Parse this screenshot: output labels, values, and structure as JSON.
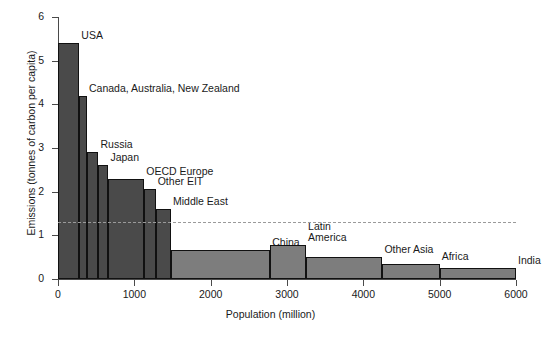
{
  "chart_data": {
    "type": "bar",
    "title": "",
    "subtitle": "",
    "xlabel": "Population (million)",
    "ylabel": "Emissions (tonnes of carbon per capita)",
    "xlim": [
      0,
      6000
    ],
    "ylim": [
      0,
      6
    ],
    "xticks": [
      0,
      1000,
      2000,
      3000,
      4000,
      5000,
      6000
    ],
    "xtick_labels": [
      "0",
      "1000",
      "2000",
      "3000",
      "4000",
      "5000",
      "6000"
    ],
    "yticks": [
      0,
      1,
      2,
      3,
      4,
      5,
      6
    ],
    "ytick_labels": [
      "0",
      "1",
      "2",
      "3",
      "4",
      "5",
      "6"
    ],
    "grid": false,
    "legend": "none",
    "note": "Variable-width bar chart (Marimekko style): bar width = population, bar height = per-capita emissions",
    "annotations": [
      {
        "name": "world-average-reference-line",
        "style": "dashed",
        "orientation": "horizontal",
        "y_value": 1.3,
        "color": "#9a9a9a",
        "x_from": 0,
        "x_to": 6000
      }
    ],
    "bars": [
      {
        "label": "USA",
        "x_start": 0,
        "x_end": 280,
        "population": 280,
        "emissions": 5.4,
        "color": "#4a4a4a",
        "label_pos": "above-right"
      },
      {
        "label": "Canada, Australia, New Zealand",
        "x_start": 280,
        "x_end": 380,
        "population": 100,
        "emissions": 4.2,
        "color": "#4a4a4a",
        "label_pos": "above-right"
      },
      {
        "label": "Russia",
        "x_start": 380,
        "x_end": 530,
        "population": 150,
        "emissions": 2.9,
        "color": "#4a4a4a",
        "label_pos": "above-right"
      },
      {
        "label": "Japan",
        "x_start": 530,
        "x_end": 660,
        "population": 130,
        "emissions": 2.6,
        "color": "#4a4a4a",
        "label_pos": "above-right"
      },
      {
        "label": "OECD Europe",
        "x_start": 660,
        "x_end": 1130,
        "population": 470,
        "emissions": 2.3,
        "color": "#4a4a4a",
        "label_pos": "above-right"
      },
      {
        "label": "Other EIT",
        "x_start": 1130,
        "x_end": 1280,
        "population": 150,
        "emissions": 2.05,
        "color": "#4a4a4a",
        "label_pos": "above-right"
      },
      {
        "label": "Middle East",
        "x_start": 1280,
        "x_end": 1480,
        "population": 200,
        "emissions": 1.6,
        "color": "#4a4a4a",
        "label_pos": "above-right"
      },
      {
        "label": "China",
        "x_start": 1480,
        "x_end": 2780,
        "population": 1300,
        "emissions": 0.67,
        "color": "#7d7d7d",
        "label_pos": "above-right"
      },
      {
        "label": "Latin America",
        "x_start": 2780,
        "x_end": 3250,
        "population": 470,
        "emissions": 0.78,
        "color": "#7d7d7d",
        "label_pos": "above-right"
      },
      {
        "label": "Other Asia",
        "x_start": 3250,
        "x_end": 4250,
        "population": 1000,
        "emissions": 0.5,
        "color": "#7d7d7d",
        "label_pos": "above-right"
      },
      {
        "label": "Africa",
        "x_start": 4250,
        "x_end": 5000,
        "population": 750,
        "emissions": 0.35,
        "color": "#7d7d7d",
        "label_pos": "above-right"
      },
      {
        "label": "India",
        "x_start": 5000,
        "x_end": 6000,
        "population": 1000,
        "emissions": 0.25,
        "color": "#7d7d7d",
        "label_pos": "above-right"
      }
    ]
  }
}
